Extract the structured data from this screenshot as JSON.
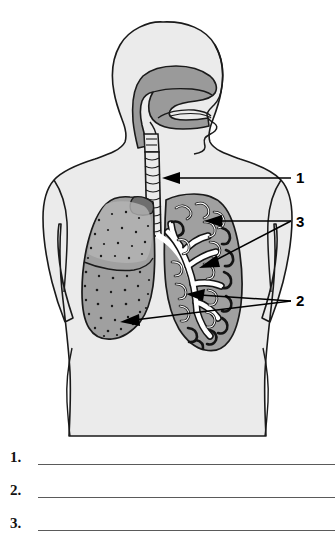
{
  "worksheet": {
    "title": "Respiratory System Labeling Worksheet",
    "background_color": "#ffffff"
  },
  "diagram": {
    "name": "human-respiratory-system",
    "view": "anterior torso with sagittal head section",
    "colors": {
      "body_fill": "#ebebeb",
      "body_outline": "#1a1a1a",
      "airway_fill": "#9a9a9a",
      "lung_fill": "#a0a0a0",
      "lung_fill_light": "#b4b4b4",
      "bronchial_tree": "#ffffff",
      "stipple": "#1a1a1a",
      "leader_line": "#000000"
    },
    "structures": [
      {
        "name": "head",
        "label": "head and neck, sagittal section"
      },
      {
        "name": "nasal-cavity",
        "label": "nasal cavity"
      },
      {
        "name": "pharynx",
        "label": "pharynx"
      },
      {
        "name": "larynx",
        "label": "larynx"
      },
      {
        "name": "trachea",
        "label": "trachea"
      },
      {
        "name": "left-lung-stippled",
        "label": "lung, surface view"
      },
      {
        "name": "right-lung-sectioned",
        "label": "lung, cut away showing bronchial tree"
      },
      {
        "name": "bronchi",
        "label": "bronchi"
      },
      {
        "name": "bronchioles",
        "label": "bronchioles"
      },
      {
        "name": "diaphragm-region",
        "label": "base of lungs"
      }
    ]
  },
  "callouts": [
    {
      "id": "1",
      "number": "1",
      "target": "trachea",
      "leader_count": 1
    },
    {
      "id": "3",
      "number": "3",
      "target": "bronchi",
      "leader_count": 2
    },
    {
      "id": "2",
      "number": "2",
      "target": "lungs",
      "leader_count": 2
    }
  ],
  "answers": {
    "rows": [
      {
        "number": "1.",
        "value": "",
        "placeholder": ""
      },
      {
        "number": "2.",
        "value": "",
        "placeholder": ""
      },
      {
        "number": "3.",
        "value": "",
        "placeholder": ""
      }
    ]
  }
}
